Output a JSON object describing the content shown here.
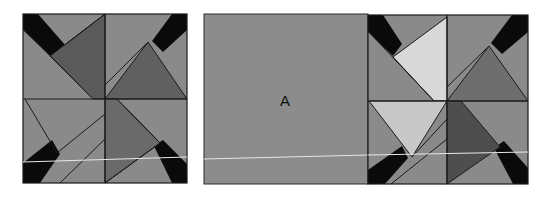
{
  "figure": {
    "colors": {
      "background": "#ffffff",
      "base_gray": "#8a8a8a",
      "dark_gray": "#5a5a5a",
      "mid_dark": "#6e6e6e",
      "light_gray": "#c8c8c8",
      "lighter_gray": "#d8d8d8",
      "black_band": "#0a0a0a",
      "outline": "#1a1a1a",
      "scan_line": "#e8e8e8"
    },
    "left_block": {
      "name": "left-pinwheel-block",
      "bounds": {
        "x": 23,
        "y": 14,
        "w": 164,
        "h": 169
      }
    },
    "square_a": {
      "name": "square-a",
      "label": "A",
      "bounds": {
        "x": 204,
        "y": 14,
        "w": 164,
        "h": 170
      }
    },
    "right_block": {
      "name": "right-pinwheel-block",
      "bounds": {
        "x": 368,
        "y": 15,
        "w": 160,
        "h": 169
      }
    }
  }
}
